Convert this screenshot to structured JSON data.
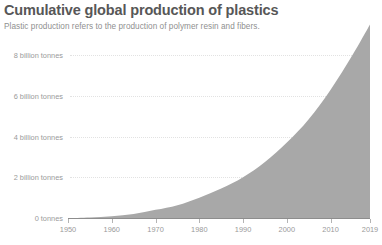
{
  "chart_data": {
    "type": "area",
    "title": "Cumulative global production of plastics",
    "subtitle": "Plastic production refers to the production of polymer resin and fibers.",
    "xlabel": "",
    "ylabel": "",
    "xlim": [
      1950,
      2019
    ],
    "ylim": [
      0,
      9.6
    ],
    "grid": true,
    "legend": null,
    "unit": "billion tonnes",
    "series_color": "#a8a8a8",
    "x": [
      1950,
      1955,
      1960,
      1965,
      1970,
      1975,
      1980,
      1985,
      1990,
      1995,
      2000,
      2005,
      2010,
      2015,
      2019
    ],
    "values": [
      0.0,
      0.03,
      0.09,
      0.2,
      0.4,
      0.63,
      1.0,
      1.45,
      2.0,
      2.75,
      3.7,
      4.85,
      6.3,
      8.0,
      9.5
    ],
    "y_ticks": [
      0,
      2,
      4,
      6,
      8
    ],
    "y_tick_labels": [
      "0 tonnes",
      "2 billion tonnes",
      "4 billion tonnes",
      "6 billion tonnes",
      "8 billion tonnes"
    ],
    "x_ticks": [
      1950,
      1960,
      1970,
      1980,
      1990,
      2000,
      2010,
      2019
    ],
    "x_tick_labels": [
      "1950",
      "1960",
      "1970",
      "1980",
      "1990",
      "2000",
      "2010",
      "2019"
    ]
  },
  "colors": {
    "title": "#575757",
    "subtitle": "#8f8f8f",
    "tick_label": "#9a9a9a",
    "grid": "#e2e2e2",
    "axis": "#8d8d8d",
    "area_fill": "#a8a8a8",
    "background": "#ffffff"
  }
}
